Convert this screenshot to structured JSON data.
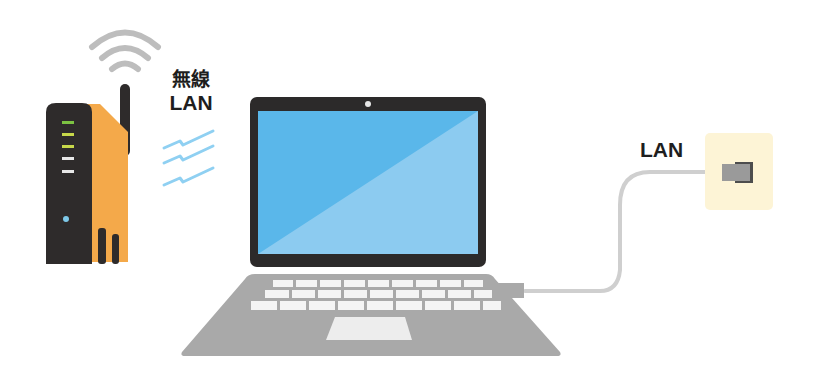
{
  "diagram": {
    "labels": {
      "wireless_line1": "無線",
      "wireless_line2": "LAN",
      "wired": "LAN"
    },
    "nodes": [
      {
        "id": "router",
        "label": "Wireless router",
        "leds": [
          "green",
          "yellow-green",
          "yellow-green",
          "white",
          "white"
        ]
      },
      {
        "id": "laptop",
        "label": "Laptop"
      },
      {
        "id": "wall-port",
        "label": "LAN wall outlet"
      }
    ],
    "edges": [
      {
        "from": "router",
        "to": "laptop",
        "type": "wireless",
        "label": "無線LAN"
      },
      {
        "from": "laptop",
        "to": "wall-port",
        "type": "cable",
        "label": "LAN"
      }
    ],
    "colors": {
      "router_body": "#2e2b2b",
      "router_side": "#f4a94a",
      "wifi_arcs": "#bdbdbd",
      "wireless_waves": "#8fd0f2",
      "screen_dark": "#5ab7ea",
      "screen_light": "#8ccbf0",
      "bezel": "#2c2a2a",
      "keyboard_base": "#a9a9a9",
      "keys": "#f2f2f2",
      "cable": "#cfcfcf",
      "wall_plate": "#fdf4d6",
      "plug": "#8e8e8e"
    }
  }
}
